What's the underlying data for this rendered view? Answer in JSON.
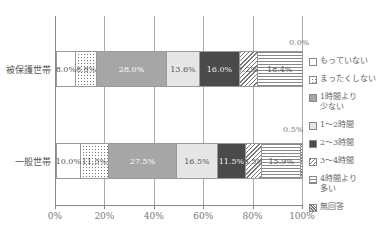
{
  "chart_data": {
    "type": "bar",
    "orientation": "horizontal",
    "stacked": true,
    "percent": true,
    "title": "",
    "xlabel": "",
    "ylabel": "",
    "xlim": [
      0,
      100
    ],
    "x_ticks": [
      "0%",
      "20%",
      "40%",
      "60%",
      "80%",
      "100%"
    ],
    "grid": true,
    "legend_position": "right",
    "categories": [
      "被保護世帯",
      "一般世帯"
    ],
    "series": [
      {
        "name": "もっていない",
        "values": [
          8.0,
          10.0
        ],
        "labels": [
          "8.0%",
          "10.0%"
        ]
      },
      {
        "name": "まったくしない",
        "values": [
          8.8,
          11.5
        ],
        "labels": [
          "8.8%",
          "11.5%"
        ]
      },
      {
        "name": "1時間より少ない",
        "values": [
          28.0,
          27.5
        ],
        "labels": [
          "28.0%",
          "27.5%"
        ]
      },
      {
        "name": "1～2時間",
        "values": [
          13.6,
          16.5
        ],
        "labels": [
          "13.6%",
          "16.5%"
        ]
      },
      {
        "name": "2～3時間",
        "values": [
          16.0,
          11.5
        ],
        "labels": [
          "16.0%",
          "11.5%"
        ]
      },
      {
        "name": "3～4時間",
        "values": [
          7.2,
          6.5
        ],
        "labels": [
          "7.2%",
          "6.5%"
        ]
      },
      {
        "name": "4時間より多い",
        "values": [
          18.4,
          15.9
        ],
        "labels": [
          "18.4%",
          "15.9%"
        ]
      },
      {
        "name": "無回答",
        "values": [
          0.0,
          0.5
        ],
        "labels": [
          "0.0%",
          "0.5%"
        ]
      }
    ]
  },
  "legend": [
    {
      "label": "もっていない"
    },
    {
      "label": "まったくしない"
    },
    {
      "label": "1時間より\n少ない"
    },
    {
      "label": "1～2時間"
    },
    {
      "label": "2～3時間"
    },
    {
      "label": "3～4時間"
    },
    {
      "label": "4時間より\n多い"
    },
    {
      "label": "無回答"
    }
  ],
  "annotations": {
    "row1_noanswer": "0.0%",
    "row2_noanswer": "0.5%"
  }
}
